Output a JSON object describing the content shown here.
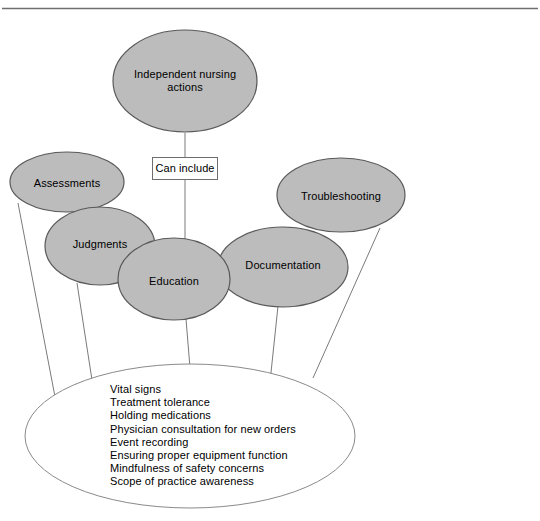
{
  "figure": {
    "title_node": {
      "label": "Independent nursing\nactions"
    },
    "connector_box": {
      "label": "Can include"
    },
    "category_nodes": [
      {
        "label": "Assessments"
      },
      {
        "label": "Judgments"
      },
      {
        "label": "Education"
      },
      {
        "label": "Documentation"
      },
      {
        "label": "Troubleshooting"
      }
    ],
    "detail_items": [
      "Vital signs",
      "Treatment tolerance",
      "Holding medications",
      "Physician consultation for new orders",
      "Event recording",
      "Ensuring proper equipment function",
      "Mindfulness of safety concerns",
      "Scope of practice awareness"
    ],
    "colors": {
      "node_fill": "#bcbcbc",
      "node_stroke": "#595959",
      "line_stroke": "#7a7a7a",
      "detail_fill": "#ffffff",
      "detail_stroke": "#8a8a8a",
      "top_rule": "#6e6e6e",
      "text": "#000000"
    }
  }
}
